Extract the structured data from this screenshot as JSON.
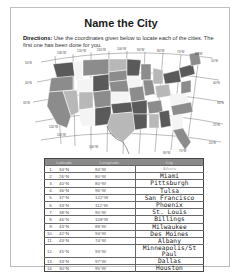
{
  "worksheet": {
    "title": "Name the City",
    "directions_label": "Directions:",
    "directions_text": " Use the coordinates given below to locate each of the cities. The first one has been done for you."
  },
  "map": {
    "longitude_labels": [
      "130°W",
      "120°W",
      "110°W",
      "100°W",
      "90°W",
      "80°W",
      "70°W",
      "60°W"
    ],
    "latitude_labels": [
      "50°N",
      "45°N",
      "40°N",
      "35°N",
      "30°N",
      "25°N"
    ],
    "bottom_labels": [
      "120°W",
      "110°W",
      "100°W",
      "90°W",
      "80°W",
      "70°W"
    ],
    "colors": {
      "dark": "#5a5a5a",
      "mid": "#8c8c8c",
      "light": "#b8b8b8",
      "white": "#f4f4f4"
    }
  },
  "table": {
    "headers": [
      "Latitude",
      "Longitude",
      "City"
    ],
    "rows": [
      {
        "num": "1.",
        "lat": "34°N",
        "lon": "84°W",
        "city": "Atlanta",
        "example": true
      },
      {
        "num": "2.",
        "lat": "26°N",
        "lon": "80°W",
        "city": "Miami"
      },
      {
        "num": "3.",
        "lat": "40°N",
        "lon": "80°W",
        "city": "Pittsburgh"
      },
      {
        "num": "4.",
        "lat": "36°N",
        "lon": "96°W",
        "city": "Tulsa"
      },
      {
        "num": "5.",
        "lat": "37°N",
        "lon": "122°W",
        "city": "San Francisco"
      },
      {
        "num": "6.",
        "lat": "33°N",
        "lon": "112°W",
        "city": "Phoenix"
      },
      {
        "num": "7.",
        "lat": "38°N",
        "lon": "90°W",
        "city": "St. Louis"
      },
      {
        "num": "8.",
        "lat": "46°N",
        "lon": "108°W",
        "city": "Billings"
      },
      {
        "num": "9.",
        "lat": "43°N",
        "lon": "88°W",
        "city": "Milwaukee"
      },
      {
        "num": "10.",
        "lat": "42°N",
        "lon": "94°W",
        "city": "Des Moines"
      },
      {
        "num": "11.",
        "lat": "43°N",
        "lon": "74°W",
        "city": "Albany"
      },
      {
        "num": "12.",
        "lat": "45°N",
        "lon": "93°W",
        "city": "Minneapolis/St Paul"
      },
      {
        "num": "13.",
        "lat": "33°N",
        "lon": "97°W",
        "city": "Dallas"
      },
      {
        "num": "14.",
        "lat": "30°N",
        "lon": "95°W",
        "city": "Houston"
      }
    ]
  }
}
